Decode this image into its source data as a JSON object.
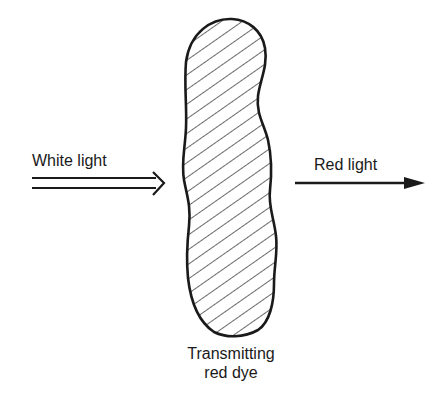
{
  "diagram": {
    "incoming_label": "White light",
    "outgoing_label": "Red light",
    "filter_label_line1": "Transmitting",
    "filter_label_line2": "red dye",
    "colors": {
      "ink": "#1a1a1a",
      "background": "#ffffff"
    }
  }
}
